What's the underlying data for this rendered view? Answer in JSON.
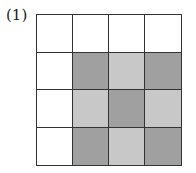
{
  "label": "(1)",
  "colors": {
    "white": "#ffffff",
    "dark": "#a0a0a0",
    "light": "#c8c8c8"
  },
  "grid": [
    [
      "white",
      "white",
      "white",
      "white"
    ],
    [
      "white",
      "dark",
      "light",
      "dark"
    ],
    [
      "white",
      "light",
      "dark",
      "light"
    ],
    [
      "white",
      "dark",
      "light",
      "dark"
    ]
  ]
}
